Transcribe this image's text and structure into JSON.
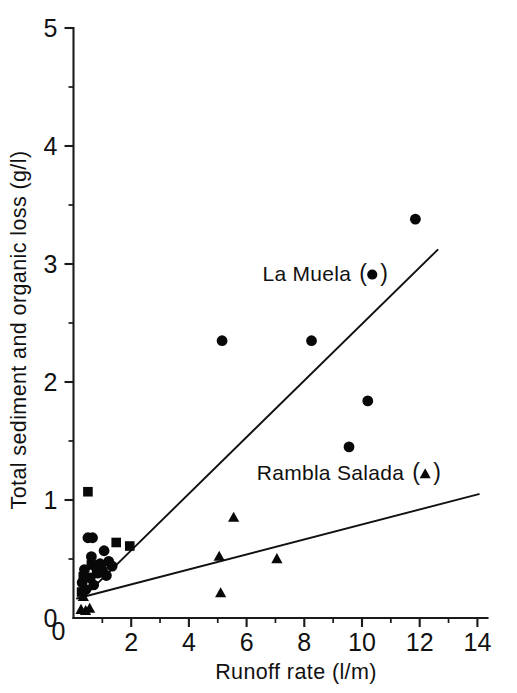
{
  "chart_data": {
    "type": "scatter",
    "title": "",
    "xlabel": "Runoff rate  (l/m)",
    "ylabel": "Total sediment and organic loss  (g/l)",
    "xlim": [
      0,
      14.35
    ],
    "ylim": [
      0,
      5
    ],
    "xticks": [
      0,
      2,
      4,
      6,
      8,
      10,
      12,
      14
    ],
    "xticklabels": [
      "0",
      "2",
      "4",
      "6",
      "8",
      "10",
      "12",
      "14"
    ],
    "yticks": [
      0,
      1,
      2,
      3,
      4,
      5
    ],
    "yticklabels": [
      "0",
      "1",
      "2",
      "3",
      "4",
      "5"
    ],
    "xminorticks": [
      1,
      3,
      5,
      7,
      9,
      11,
      13
    ],
    "yminorticks": [
      0.5,
      1.5,
      2.5,
      3.5,
      4.5
    ],
    "grid": false,
    "legend_position": "inside-right",
    "series": [
      {
        "name": "La Muela",
        "marker": "circle",
        "legend_label": "La Muela",
        "legend_symbol": "●",
        "points": [
          [
            0.3,
            0.3
          ],
          [
            0.38,
            0.41
          ],
          [
            0.42,
            0.24
          ],
          [
            0.5,
            0.68
          ],
          [
            0.58,
            0.34
          ],
          [
            0.62,
            0.52
          ],
          [
            0.66,
            0.68
          ],
          [
            0.7,
            0.28
          ],
          [
            0.78,
            0.43
          ],
          [
            0.84,
            0.38
          ],
          [
            0.92,
            0.46
          ],
          [
            0.98,
            0.41
          ],
          [
            1.06,
            0.57
          ],
          [
            1.14,
            0.36
          ],
          [
            1.22,
            0.48
          ],
          [
            1.34,
            0.44
          ],
          [
            5.15,
            2.35
          ],
          [
            8.25,
            2.35
          ],
          [
            9.55,
            1.45
          ],
          [
            10.2,
            1.84
          ],
          [
            11.85,
            3.38
          ]
        ]
      },
      {
        "name": "Rambla Salada",
        "marker": "triangle",
        "legend_label": "Rambla Salada",
        "legend_symbol": "▲",
        "points": [
          [
            0.26,
            0.07
          ],
          [
            0.34,
            0.18
          ],
          [
            0.42,
            0.06
          ],
          [
            0.56,
            0.08
          ],
          [
            5.05,
            0.52
          ],
          [
            5.1,
            0.21
          ],
          [
            5.55,
            0.85
          ],
          [
            7.05,
            0.5
          ]
        ]
      },
      {
        "name": "",
        "marker": "square",
        "legend_label": "",
        "legend_symbol": "■",
        "points": [
          [
            0.28,
            0.22
          ],
          [
            0.34,
            0.35
          ],
          [
            0.5,
            1.07
          ],
          [
            0.62,
            0.45
          ],
          [
            0.8,
            0.4
          ],
          [
            1.02,
            0.39
          ],
          [
            1.48,
            0.64
          ],
          [
            1.95,
            0.61
          ]
        ]
      }
    ],
    "fit_lines": [
      {
        "name": "La Muela fit",
        "x0": 0.4,
        "y0": 0.19,
        "x1": 12.62,
        "y1": 3.12
      },
      {
        "name": "Rambla Salada fit",
        "x0": 0.12,
        "y0": 0.165,
        "x1": 14.05,
        "y1": 1.05
      }
    ],
    "annotations": [
      {
        "text": "La Muela",
        "x": 6.55,
        "y": 2.86
      },
      {
        "text": "Rambla Salada",
        "x": 6.35,
        "y": 1.17
      }
    ]
  },
  "axes": {
    "y_title": "Total sediment and organic loss  (g/l)",
    "x_title": "Runoff rate  (l/m)"
  },
  "legend": {
    "items": [
      {
        "label": "La Muela",
        "symbol": "●",
        "open_paren": "(",
        "close_paren": ")"
      },
      {
        "label": "Rambla Salada",
        "symbol": "▲",
        "open_paren": "(",
        "close_paren": ")"
      }
    ]
  }
}
